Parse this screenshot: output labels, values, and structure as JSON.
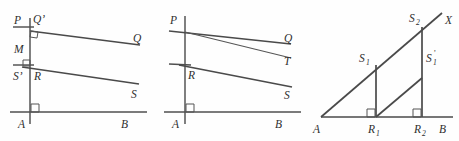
{
  "figure": {
    "panel_count": 3,
    "ink_color": "#4f4f4f",
    "label_color": "#2e2e2e",
    "background_color": "#fefefe"
  },
  "panel1": {
    "name": "left-panel",
    "labels": {
      "P": "P",
      "Qprime": "Q’",
      "Q": "Q",
      "M": "M",
      "Sprime": "S’",
      "R": "R",
      "S": "S",
      "A": "A",
      "B": "B"
    },
    "right_angle_count": 3
  },
  "panel2": {
    "name": "middle-panel",
    "labels": {
      "P": "P",
      "Q": "Q",
      "T": "T",
      "R": "R",
      "S": "S",
      "A": "A",
      "B": "B"
    },
    "right_angle_count": 1
  },
  "panel3": {
    "name": "right-panel",
    "labels": {
      "X": "X",
      "S2_base": "S",
      "S2_sub": "2",
      "S1_base": "S",
      "S1_sub": "1",
      "S1prime_base": "S",
      "S1prime_sub": "1",
      "S1prime_mark": "’",
      "A": "A",
      "R1_base": "R",
      "R1_sub": "1",
      "R2_base": "R",
      "R2_sub": "2",
      "B": "B"
    },
    "right_angle_count": 2
  }
}
